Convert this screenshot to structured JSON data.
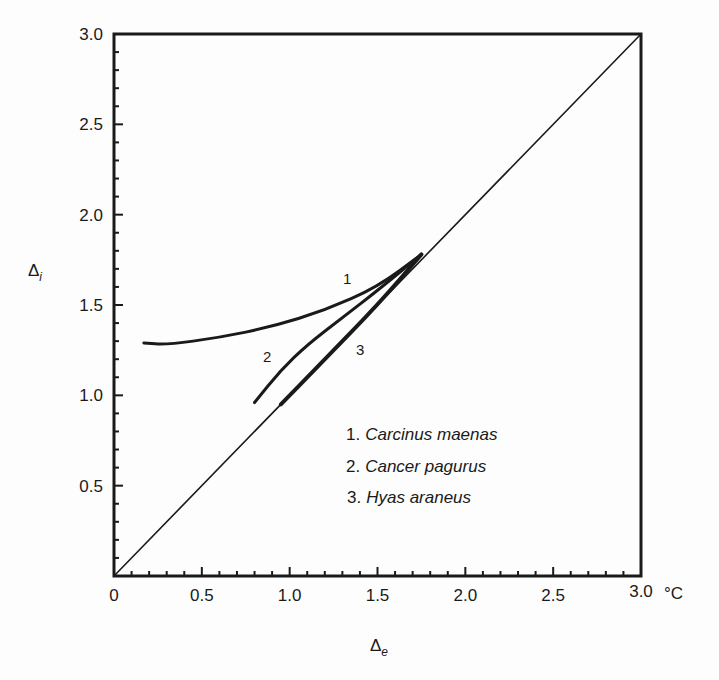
{
  "chart_data": {
    "type": "line",
    "title": "",
    "xlabel": "Δe",
    "xlabel_sub": "e",
    "ylabel": "Δi",
    "ylabel_sub": "i",
    "x_unit": "°C",
    "xlim": [
      0,
      3.0
    ],
    "ylim": [
      0,
      3.0
    ],
    "x_ticks": [
      "0",
      "0.5",
      "1.0",
      "1.5",
      "2.0",
      "2.5",
      "3.0"
    ],
    "y_ticks": [
      "0.5",
      "1.0",
      "1.5",
      "2.0",
      "2.5",
      "3.0"
    ],
    "grid": false,
    "legend_position": "inside-lower-right",
    "series": [
      {
        "name": "Isosmotic line (Δi = Δe)",
        "x": [
          0,
          3.0
        ],
        "y": [
          0,
          3.0
        ]
      },
      {
        "name": "1. Carcinus maenas",
        "label": "1",
        "x": [
          0.17,
          0.3,
          0.6,
          0.9,
          1.2,
          1.5,
          1.75
        ],
        "y": [
          1.29,
          1.28,
          1.32,
          1.38,
          1.47,
          1.6,
          1.78
        ]
      },
      {
        "name": "2. Cancer pagurus",
        "label": "2",
        "x": [
          0.8,
          0.95,
          1.1,
          1.3,
          1.5,
          1.75
        ],
        "y": [
          0.96,
          1.14,
          1.28,
          1.43,
          1.58,
          1.78
        ]
      },
      {
        "name": "3. Hyas araneus",
        "label": "3",
        "x": [
          0.95,
          1.2,
          1.5,
          1.75
        ],
        "y": [
          0.95,
          1.2,
          1.5,
          1.78
        ]
      }
    ],
    "legend": [
      {
        "num": "1.",
        "species": "Carcinus maenas"
      },
      {
        "num": "2.",
        "species": "Cancer pagurus"
      },
      {
        "num": "3.",
        "species": "Hyas araneus"
      }
    ]
  }
}
